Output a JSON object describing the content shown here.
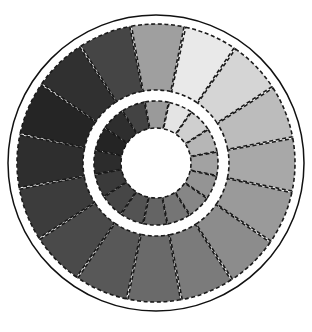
{
  "figure": {
    "title": "",
    "background_color": "#ffffff",
    "width": 312,
    "height": 332
  },
  "geometry": {
    "center_x": 156,
    "center_y": 163,
    "outline_radius": 148,
    "outer_ring_outer_radius": 139,
    "outer_ring_inner_radius": 73,
    "gap_radius": 66,
    "inner_ring_outer_radius": 62,
    "inner_ring_inner_radius": 35,
    "hub_radius": 34,
    "segment_count": 16,
    "start_angle_deg": -78,
    "outline_color": "#111111",
    "segment_border_color": "#1a1a1a",
    "segment_border_dash": "4 2.6",
    "gap_color": "#ffffff",
    "hub_color": "#ffffff"
  },
  "chart_data": {
    "type": "pie",
    "title": "",
    "subtitle": "",
    "xlabel": "",
    "ylabel": "",
    "legend_position": "none",
    "grid": false,
    "rings": [
      {
        "name": "outer-ring",
        "inner_radius": 73,
        "outer_radius": 139,
        "segment_count": 16,
        "values": [
          1,
          1,
          1,
          1,
          1,
          1,
          1,
          1,
          1,
          1,
          1,
          1,
          1,
          1,
          1,
          1
        ],
        "categories": [
          "outer-1",
          "outer-2",
          "outer-3",
          "outer-4",
          "outer-5",
          "outer-6",
          "outer-7",
          "outer-8",
          "outer-9",
          "outer-10",
          "outer-11",
          "outer-12",
          "outer-13",
          "outer-14",
          "outer-15",
          "outer-16"
        ],
        "colors": [
          "#e9e9e9",
          "#d5d5d5",
          "#bcbcbc",
          "#a8a8a8",
          "#9a9a9a",
          "#8c8c8c",
          "#7b7b7b",
          "#6a6a6a",
          "#585858",
          "#4a4a4a",
          "#3c3c3c",
          "#2e2e2e",
          "#252525",
          "#303030",
          "#454545",
          "#9f9f9f"
        ]
      },
      {
        "name": "inner-ring",
        "inner_radius": 35,
        "outer_radius": 62,
        "segment_count": 16,
        "values": [
          1,
          1,
          1,
          1,
          1,
          1,
          1,
          1,
          1,
          1,
          1,
          1,
          1,
          1,
          1,
          1
        ],
        "categories": [
          "inner-1",
          "inner-2",
          "inner-3",
          "inner-4",
          "inner-5",
          "inner-6",
          "inner-7",
          "inner-8",
          "inner-9",
          "inner-10",
          "inner-11",
          "inner-12",
          "inner-13",
          "inner-14",
          "inner-15",
          "inner-16"
        ],
        "colors": [
          "#e4e4e4",
          "#cfcfcf",
          "#b6b6b6",
          "#a2a2a2",
          "#949494",
          "#868686",
          "#757575",
          "#646464",
          "#535353",
          "#464646",
          "#3a3a3a",
          "#2c2c2c",
          "#242424",
          "#2e2e2e",
          "#434343",
          "#9a9a9a"
        ]
      }
    ]
  }
}
